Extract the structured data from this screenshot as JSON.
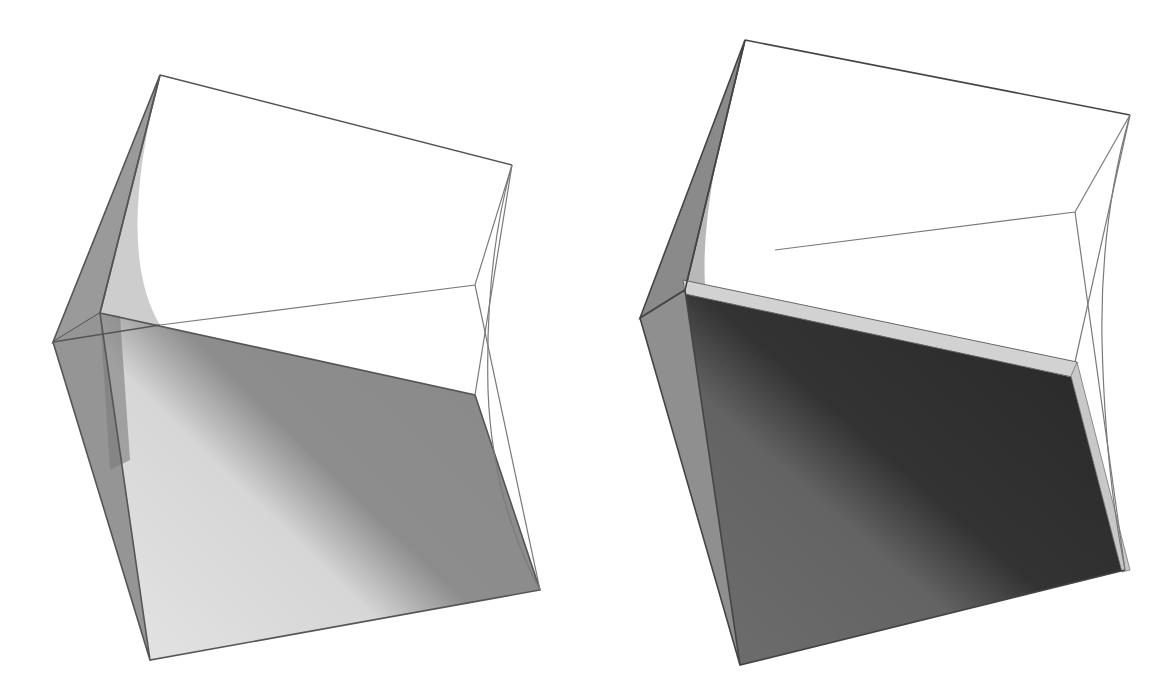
{
  "figure": {
    "panels": [
      {
        "id": "left",
        "label": "",
        "shading": "light",
        "colors": {
          "edge": "#555555",
          "thin_edge": "#7a7a7a",
          "side_fill": "#8e8e8e",
          "bottom_light": "#dcdcdc",
          "bottom_dark": "#8a8a8a"
        }
      },
      {
        "id": "right",
        "label": "",
        "shading": "dark",
        "colors": {
          "edge": "#444444",
          "thin_edge": "#7a7a7a",
          "side_fill": "#8a8a8a",
          "bottom_light": "#6a6a6a",
          "bottom_dark": "#2e2e2e",
          "ledge": "#d2d2d2"
        }
      }
    ]
  }
}
